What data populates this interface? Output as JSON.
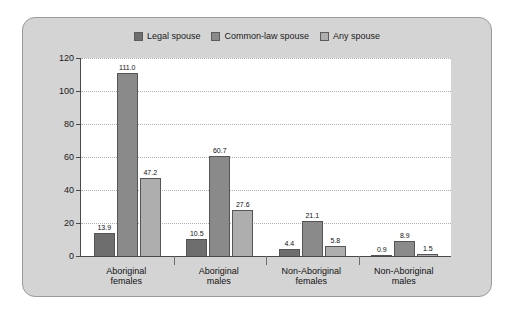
{
  "chart_data": {
    "type": "bar",
    "title": "",
    "subtitle": "",
    "xlabel": "",
    "ylabel": "Rate per million couples",
    "ylim": [
      0,
      120
    ],
    "ytick_step": 20,
    "yticks": [
      120,
      100,
      80,
      60,
      40,
      20,
      0
    ],
    "grid": true,
    "legend_position": "top-center",
    "categories": [
      "Aboriginal females",
      "Aboriginal males",
      "Non-Aboriginal females",
      "Non-Aboriginal males"
    ],
    "category_lines": [
      [
        "Aboriginal",
        "females"
      ],
      [
        "Aboriginal",
        "males"
      ],
      [
        "Non-Aboriginal",
        "females"
      ],
      [
        "Non-Aboriginal",
        "males"
      ]
    ],
    "series": [
      {
        "name": "Legal spouse",
        "color": "#6e6e6e",
        "values": [
          13.9,
          10.5,
          4.4,
          0.9
        ],
        "labels": [
          "13.9",
          "10.5",
          "4.4",
          "0.9"
        ]
      },
      {
        "name": "Common-law spouse",
        "color": "#8a8a8a",
        "values": [
          111.0,
          60.7,
          21.1,
          8.9
        ],
        "labels": [
          "111.0",
          "60.7",
          "21.1",
          "8.9"
        ]
      },
      {
        "name": "Any spouse",
        "color": "#aeaeae",
        "values": [
          47.2,
          27.6,
          5.8,
          1.5
        ],
        "labels": [
          "47.2",
          "27.6",
          "5.8",
          "1.5"
        ]
      }
    ]
  },
  "legend": {
    "items": [
      {
        "label": "Legal spouse",
        "color": "#6e6e6e"
      },
      {
        "label": "Common-law spouse",
        "color": "#8a8a8a"
      },
      {
        "label": "Any spouse",
        "color": "#aeaeae"
      }
    ]
  },
  "axis": {
    "y_title": "Rate per million couples",
    "y_ticks": [
      "120",
      "100",
      "80",
      "60",
      "40",
      "20",
      "0"
    ]
  },
  "colors": {
    "card_background": "#d4d4d4",
    "card_border": "#9a9a9a",
    "plot_background": "#ffffff",
    "axis": "#4a4a4a",
    "gridline": "#b0b0b0",
    "text": "#111111"
  }
}
